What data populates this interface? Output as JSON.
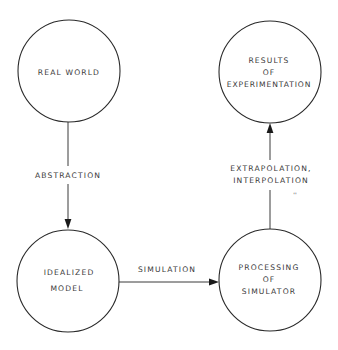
{
  "diagram": {
    "type": "flow",
    "colors": {
      "stroke": "#2a2a2a",
      "text": "#3a3a3a",
      "background": "#ffffff"
    },
    "nodes": [
      {
        "id": "real_world",
        "shape": "circle",
        "lines": [
          "REAL WORLD"
        ]
      },
      {
        "id": "idealized_model",
        "shape": "circle",
        "lines": [
          "IDEALIZED",
          "MODEL"
        ]
      },
      {
        "id": "processing_of_simulator",
        "shape": "circle",
        "lines": [
          "PROCESSING",
          "OF",
          "SIMULATOR"
        ]
      },
      {
        "id": "results_of_experimentation",
        "shape": "circle",
        "lines": [
          "RESULTS",
          "OF",
          "EXPERIMENTATION"
        ]
      }
    ],
    "edges": [
      {
        "from": "real_world",
        "to": "idealized_model",
        "lines": [
          "ABSTRACTION"
        ]
      },
      {
        "from": "idealized_model",
        "to": "processing_of_simulator",
        "lines": [
          "SIMULATION"
        ]
      },
      {
        "from": "processing_of_simulator",
        "to": "results_of_experimentation",
        "lines": [
          "EXTRAPOLATION,",
          "INTERPOLATION"
        ],
        "annotation": "''"
      }
    ]
  }
}
